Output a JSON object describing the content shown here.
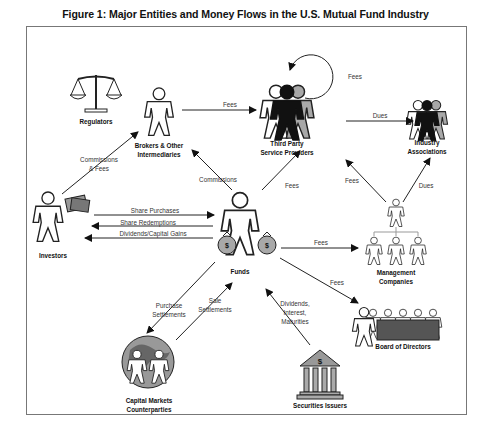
{
  "figure": {
    "title": "Figure 1:  Major Entities and Money Flows in the U.S. Mutual Fund Industry"
  },
  "entities": {
    "regulators": "Regulators",
    "brokers_l1": "Brokers & Other",
    "brokers_l2": "Intermediaries",
    "third_party_l1": "Third Party",
    "third_party_l2": "Service Providers",
    "industry_l1": "Industry",
    "industry_l2": "Associations",
    "investors": "Investors",
    "funds": "Funds",
    "mgmt_l1": "Management",
    "mgmt_l2": "Companies",
    "board": "Board of Directors",
    "capital_l1": "Capital Markets",
    "capital_l2": "Counterparties",
    "issuers": "Securities Issuers"
  },
  "flows": {
    "tp_self_fees": "Fees",
    "brokers_to_tp_fees": "Fees",
    "tp_to_industry_dues": "Dues",
    "investors_brokers_l1": "Commissions",
    "investors_brokers_l2": "& Fees",
    "funds_brokers_commissions": "Commissions",
    "funds_tp_fees": "Fees",
    "mgmt_tp_fees": "Fees",
    "mgmt_industry_dues": "Dues",
    "share_purchases": "Share Purchases",
    "share_redemptions": "Share Redemptions",
    "dividends_gains": "Dividends/Capital Gains",
    "funds_mgmt_fees": "Fees",
    "funds_board_fees": "Fees",
    "purchase_settlements_l1": "Purchase",
    "purchase_settlements_l2": "Settlements",
    "sale_settlements_l1": "Sale",
    "sale_settlements_l2": "Settlements",
    "issuer_flows_l1": "Dividends,",
    "issuer_flows_l2": "Interest,",
    "issuer_flows_l3": "Maturities"
  },
  "icons": {
    "money_bag_symbol": "$",
    "bank_symbol": "$"
  },
  "colors": {
    "line": "#222222",
    "gray_fill": "#a8a8a8",
    "dark_fill": "#111111",
    "frame": "#777777"
  }
}
